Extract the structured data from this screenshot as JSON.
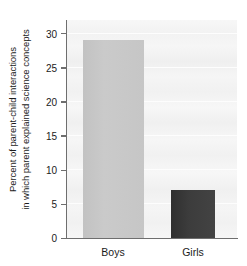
{
  "chart_data": {
    "type": "bar",
    "title": "",
    "subtitle": "",
    "xlabel": "",
    "ylabel_lines": [
      "Percent of parent-child interactions",
      "in which parent explained science concepts"
    ],
    "ylabel": "Percent of parent-child interactions in which parent explained science concepts",
    "categories": [
      "Boys",
      "Girls"
    ],
    "values": [
      29,
      7
    ],
    "ylim": [
      0,
      32
    ],
    "yticks": [
      0,
      5,
      10,
      15,
      20,
      25,
      30
    ],
    "ytick_labels": [
      "0",
      "5",
      "10",
      "15",
      "20",
      "25",
      "30"
    ],
    "grid": true,
    "legend": "none",
    "bar_colors": [
      "#c6c6c6",
      "#3a3a3a"
    ],
    "plot_background": "#f3f3f3",
    "axis_color": "#6e6e6e",
    "text_color": "#1b1b1b"
  }
}
